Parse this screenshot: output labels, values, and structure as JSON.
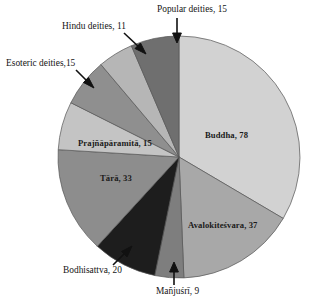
{
  "chart_data": {
    "type": "pie",
    "title": "",
    "subtitle": "",
    "xlabel": "",
    "ylabel": "",
    "legend_position": "none",
    "grid": false,
    "total": 233,
    "start_angle_deg": 0,
    "direction": "clockwise",
    "categories": [
      "Buddha",
      "Avalokiteśvara",
      "Mañjuśrī",
      "Bodhisattva",
      "Tārā",
      "Prajñāpāramitā",
      "Esoteric deities",
      "Hindu deities",
      "Popular deities"
    ],
    "values": [
      78,
      37,
      9,
      20,
      33,
      15,
      15,
      11,
      15
    ],
    "slices": [
      {
        "name": "Buddha",
        "value": 78,
        "label": "Buddha, 78",
        "color": "#d2d2d2",
        "label_placement": "inside"
      },
      {
        "name": "Avalokiteśvara",
        "value": 37,
        "label": "Avalokiteśvara, 37",
        "color": "#a8a8a8",
        "label_placement": "inside"
      },
      {
        "name": "Mañjuśrī",
        "value": 9,
        "label": "Mañjuśrī, 9",
        "color": "#7e7e7e",
        "label_placement": "callout"
      },
      {
        "name": "Bodhisattva",
        "value": 20,
        "label": "Bodhisattva, 20",
        "color": "#1d1d1d",
        "label_placement": "callout"
      },
      {
        "name": "Tārā",
        "value": 33,
        "label": "Tārā, 33",
        "color": "#8d8d8d",
        "label_placement": "inside"
      },
      {
        "name": "Prajñāpāramitā",
        "value": 15,
        "label": "Prajñāpāramitā, 15",
        "color": "#c4c4c4",
        "label_placement": "inside"
      },
      {
        "name": "Esoteric deities",
        "value": 15,
        "label": "Esoteric deities,15",
        "color": "#8f8f8f",
        "label_placement": "callout"
      },
      {
        "name": "Hindu deities",
        "value": 11,
        "label": "Hindu deities, 11",
        "color": "#b6b6b6",
        "label_placement": "callout"
      },
      {
        "name": "Popular deities",
        "value": 15,
        "label": "Popular deities, 15",
        "color": "#6f6f6f",
        "label_placement": "callout"
      }
    ]
  },
  "labels": {
    "buddha": "Buddha, 78",
    "avalokitesvara": "Avalokiteśvara, 37",
    "manjusri": "Mañjuśrī, 9",
    "bodhisattva": "Bodhisattva, 20",
    "tara": "Tārā, 33",
    "prajnaparamita": "Prajñāpāramitā, 15",
    "esoteric": "Esoteric deities,15",
    "hindu": "Hindu deities, 11",
    "popular": "Popular deities, 15"
  },
  "colors": {
    "background": "#ffffff",
    "outline": "#555555",
    "text": "#1a1a1a",
    "arrow": "#111111"
  }
}
